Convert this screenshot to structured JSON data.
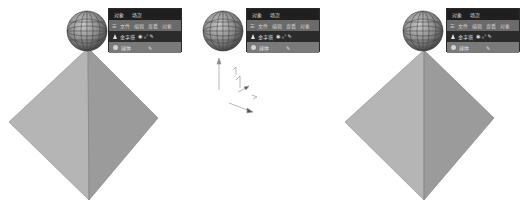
{
  "panels": [
    {
      "tabs": [
        "对象",
        "场次"
      ],
      "menu": [
        "☰",
        "文件",
        "编辑",
        "查看",
        "对象"
      ],
      "objects": [
        {
          "name": "金字塔",
          "icon": "pyramid-icon",
          "flags": "◉ ⤢ ✎"
        },
        {
          "name": "球体",
          "icon": "sphere-icon",
          "flags": "✎"
        }
      ]
    },
    {
      "tabs": [
        "对象",
        "场次"
      ],
      "menu": [
        "☰",
        "文件",
        "编辑",
        "查看",
        "对象"
      ],
      "objects": [
        {
          "name": "金字塔",
          "icon": "pyramid-icon",
          "flags": "◉ ⤢ ✎"
        },
        {
          "name": "球体",
          "icon": "sphere-icon",
          "flags": "✎"
        }
      ]
    },
    {
      "tabs": [
        "对象",
        "场次"
      ],
      "menu": [
        "☰",
        "文件",
        "编辑",
        "查看",
        "对象"
      ],
      "objects": [
        {
          "name": "金字塔",
          "icon": "pyramid-icon",
          "flags": "◉ ⤢ ✎"
        },
        {
          "name": "球体",
          "icon": "sphere-icon",
          "flags": "✎"
        }
      ]
    }
  ],
  "colors": {
    "pyramid_left": "#b4b4b4",
    "pyramid_right": "#9a9a9a",
    "sphere": "#8c8c8c",
    "panel_bg": "#3a3a3a"
  }
}
